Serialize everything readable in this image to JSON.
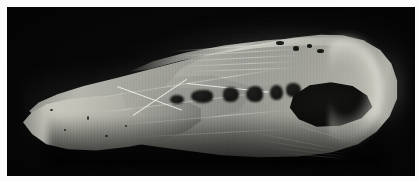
{
  "figure": {
    "kind": "photograph",
    "caption": "",
    "orientation": "landscape",
    "width_px": 419,
    "height_px": 181,
    "color_mode": "grayscale"
  },
  "frame": {
    "present": true,
    "color": "#fbfbfb",
    "border_left_px": 7,
    "border_top_px": 7,
    "border_right_px": 4,
    "border_bottom_px": 5
  },
  "plate": {
    "background_color": "#040404",
    "left_px": 7,
    "top_px": 7,
    "width_px": 408,
    "height_px": 169
  },
  "palette": {
    "background": "#040404",
    "frame": "#fbfbfb",
    "specimen_highlight": "#f4f4ec",
    "specimen_midtone": "#a2a29a",
    "specimen_shadow": "#4a4a46",
    "dark_structures": "#121210",
    "halo": "#d2d2cd"
  },
  "regions": [
    {
      "id": "tail-lobe",
      "label": "left tapering lobe",
      "note": "smooth bright wedge narrowing to a point at the far left, carrying a few small dark speckles",
      "brightness": "high"
    },
    {
      "id": "dorsal-ridge",
      "label": "upper bright ridge band",
      "note": "a long highlighted crest sweeping from lower-left up to the blunt right end",
      "brightness": "very-high"
    },
    {
      "id": "membrane-panel",
      "label": "pale translucent membrane",
      "note": "semi-transparent sheet in the upper-middle with fine parallel striations",
      "brightness": "medium-high"
    },
    {
      "id": "triangular-flap",
      "label": "triangular flap",
      "note": "large wedge-shaped plate in the centre with a sharp bright lower margin forming a V",
      "brightness": "medium"
    },
    {
      "id": "dark-cluster",
      "label": "dark structure row",
      "note": "row of five or six small very dark lumps arranged horizontally through the middle of the body",
      "brightness": "very-low"
    },
    {
      "id": "right-cavity",
      "label": "large dark cavity",
      "note": "broad near-black void toward the right, bounded above and below by bright tissue",
      "brightness": "very-low"
    },
    {
      "id": "ventral-striations",
      "label": "ventral fibre striations",
      "note": "fan of fine bright parallel lines radiating toward the lower right margin",
      "brightness": "medium"
    },
    {
      "id": "right-rim",
      "label": "blunt right margin",
      "note": "rounded bright outer edge closing the body at the right, surrounded by soft glow",
      "brightness": "high"
    }
  ],
  "annotations": {
    "scale_bar": null,
    "labels": [],
    "text_overlay": ""
  }
}
